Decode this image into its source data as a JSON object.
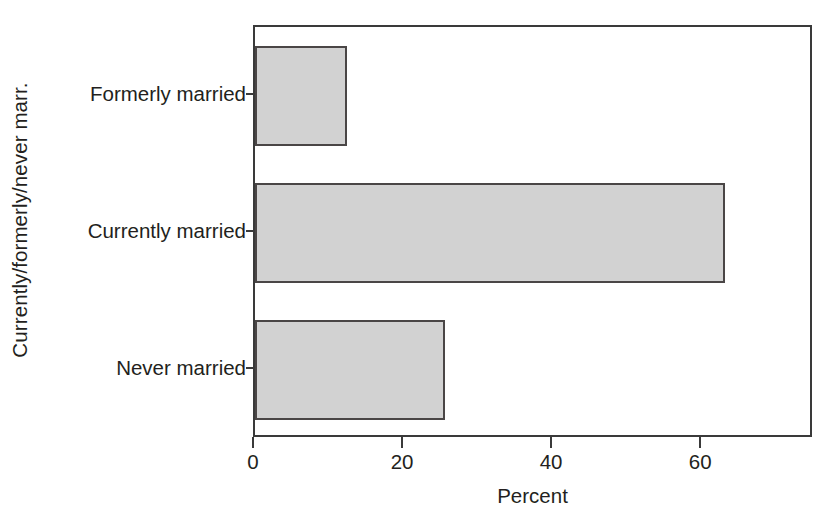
{
  "chart_data": {
    "type": "bar",
    "orientation": "horizontal",
    "title": "",
    "xlabel": "Percent",
    "ylabel": "Currently/formerly/never marr.",
    "categories": [
      "Never married",
      "Currently married",
      "Formerly married"
    ],
    "values": [
      25.5,
      63.0,
      12.3
    ],
    "xlim": [
      0,
      75
    ],
    "ylim": [
      0,
      3
    ],
    "xticks": [
      0,
      20,
      40,
      60
    ],
    "xticklabels": [
      "0",
      "20",
      "40",
      "60"
    ],
    "grid": false,
    "legend": null,
    "bar_fill_color": "#d2d2d2",
    "bar_edge_color": "#4a4646",
    "axis_color": "#3a3a3a",
    "background_color": "#ffffff"
  },
  "figure": {
    "xaxis_title": "Percent",
    "yaxis_title": "Currently/formerly/never marr."
  }
}
